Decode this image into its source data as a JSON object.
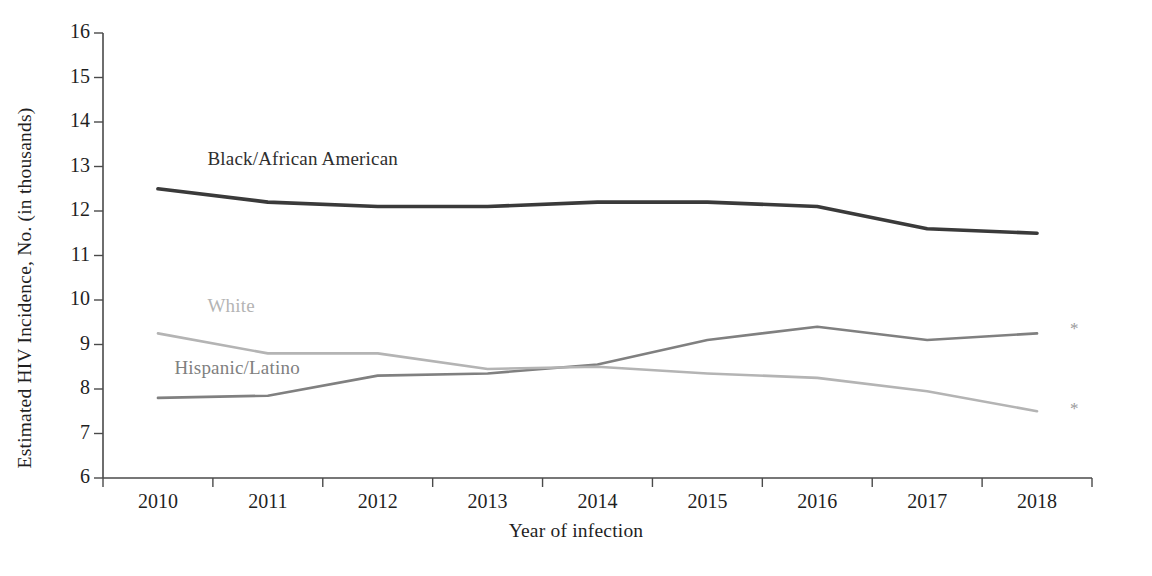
{
  "chart_data": {
    "type": "line",
    "title": "",
    "xlabel": "Year of infection",
    "ylabel": "Estimated HIV Incidence, No. (in thousands)",
    "categories": [
      "2010",
      "2011",
      "2012",
      "2013",
      "2014",
      "2015",
      "2016",
      "2017",
      "2018"
    ],
    "x": [
      2010,
      2011,
      2012,
      2013,
      2014,
      2015,
      2016,
      2017,
      2018
    ],
    "ylim": [
      6,
      16
    ],
    "yticks": [
      "6",
      "7",
      "8",
      "9",
      "10",
      "11",
      "12",
      "13",
      "14",
      "15",
      "16"
    ],
    "grid": false,
    "legend_position": "inline-labels",
    "series": [
      {
        "name": "Black/African American",
        "color": "#3a3a3a",
        "values": [
          12.5,
          12.2,
          12.1,
          12.1,
          12.2,
          12.2,
          12.1,
          11.6,
          11.5
        ],
        "label_x": 2010.45,
        "label_y": 13.15,
        "endpoint_marker": ""
      },
      {
        "name": "Hispanic/Latino",
        "color": "#808080",
        "values": [
          7.8,
          7.85,
          8.3,
          8.35,
          8.55,
          9.1,
          9.4,
          9.1,
          9.25
        ],
        "label_x": 2010.15,
        "label_y": 8.45,
        "endpoint_marker": "*"
      },
      {
        "name": "White",
        "color": "#b4b4b4",
        "values": [
          9.25,
          8.8,
          8.8,
          8.45,
          8.5,
          8.35,
          8.25,
          7.95,
          7.5
        ],
        "label_x": 2010.45,
        "label_y": 9.85,
        "endpoint_marker": "*"
      }
    ],
    "annotations": [
      {
        "name": "asterisk-hispanic-2018",
        "symbol": "*",
        "x": 2018.3,
        "y": 9.35
      },
      {
        "name": "asterisk-white-2018",
        "symbol": "*",
        "x": 2018.3,
        "y": 7.55
      }
    ]
  },
  "axes": {
    "y_axis_title": "Estimated HIV Incidence, No. (in thousands)",
    "x_axis_title": "Year of infection",
    "axis_color": "#4a4a4a"
  }
}
